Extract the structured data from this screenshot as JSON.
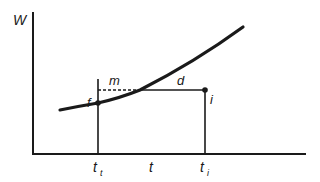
{
  "diagram": {
    "y_axis_label": "W",
    "x_axis_label": "t",
    "labels": {
      "m": "m",
      "d": "d",
      "f": "f",
      "i": "i"
    },
    "ticks": {
      "t_t": {
        "base": "t",
        "sub": "t"
      },
      "t": {
        "base": "t"
      },
      "t_i": {
        "base": "t",
        "sub": "i"
      }
    },
    "colors": {
      "ink": "#1a1a1a",
      "background": "#ffffff"
    }
  }
}
